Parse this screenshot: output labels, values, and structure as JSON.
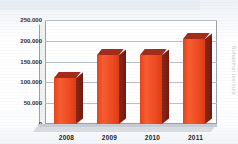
{
  "chart_data": {
    "type": "bar",
    "title": "",
    "subtitle": "",
    "xlabel": "",
    "ylabel": "",
    "categories": [
      "2008",
      "2009",
      "2010",
      "2011"
    ],
    "values": [
      110000,
      165000,
      165000,
      205000
    ],
    "series": [
      {
        "name": "",
        "values": [
          110000,
          165000,
          165000,
          205000
        ]
      }
    ],
    "ylim": [
      0,
      250000
    ],
    "ytick_values": [
      250000,
      200000,
      150000,
      100000,
      50000,
      0
    ],
    "ytick_labels": [
      "250.000",
      "200.000",
      "150.000",
      "100.000",
      "50.000",
      "0"
    ],
    "xtick_labels": [
      "2008",
      "2009",
      "2010",
      "2011"
    ],
    "grid": true,
    "legend": "none",
    "style": "3d-column",
    "bar_color": "#f0491f",
    "bar_side_color": "#7d2013",
    "bar_top_color": "#a32c19",
    "gridline_color": "#b9bec6",
    "plot_background": "#ffffff",
    "annotations": []
  },
  "watermark": {
    "text": "Rohanmat Institute"
  }
}
